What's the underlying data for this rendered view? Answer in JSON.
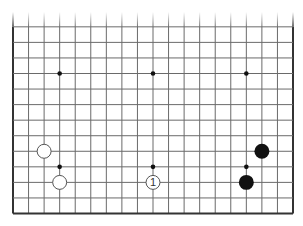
{
  "board": {
    "size": 19,
    "visible_region": "bottom rows, top edge cut off",
    "visible_rows": {
      "from": 1,
      "to": 13
    },
    "colors": {
      "background": "#ffffff",
      "grid_line": "#6a6a6a",
      "border_line": "#333333",
      "star_point": "#111111",
      "black_stone": "#111111",
      "white_stone_fill": "#ffffff",
      "white_stone_outline": "#555555"
    },
    "star_points": [
      {
        "col": 4,
        "row": 4
      },
      {
        "col": 10,
        "row": 4
      },
      {
        "col": 16,
        "row": 4
      },
      {
        "col": 4,
        "row": 10
      },
      {
        "col": 10,
        "row": 10
      },
      {
        "col": 16,
        "row": 10
      }
    ],
    "stones": [
      {
        "color": "white",
        "col": 3,
        "row": 5,
        "label": ""
      },
      {
        "color": "white",
        "col": 4,
        "row": 3,
        "label": ""
      },
      {
        "color": "white",
        "col": 10,
        "row": 3,
        "label": "1"
      },
      {
        "color": "black",
        "col": 17,
        "row": 5,
        "label": ""
      },
      {
        "color": "black",
        "col": 16,
        "row": 3,
        "label": ""
      }
    ]
  }
}
